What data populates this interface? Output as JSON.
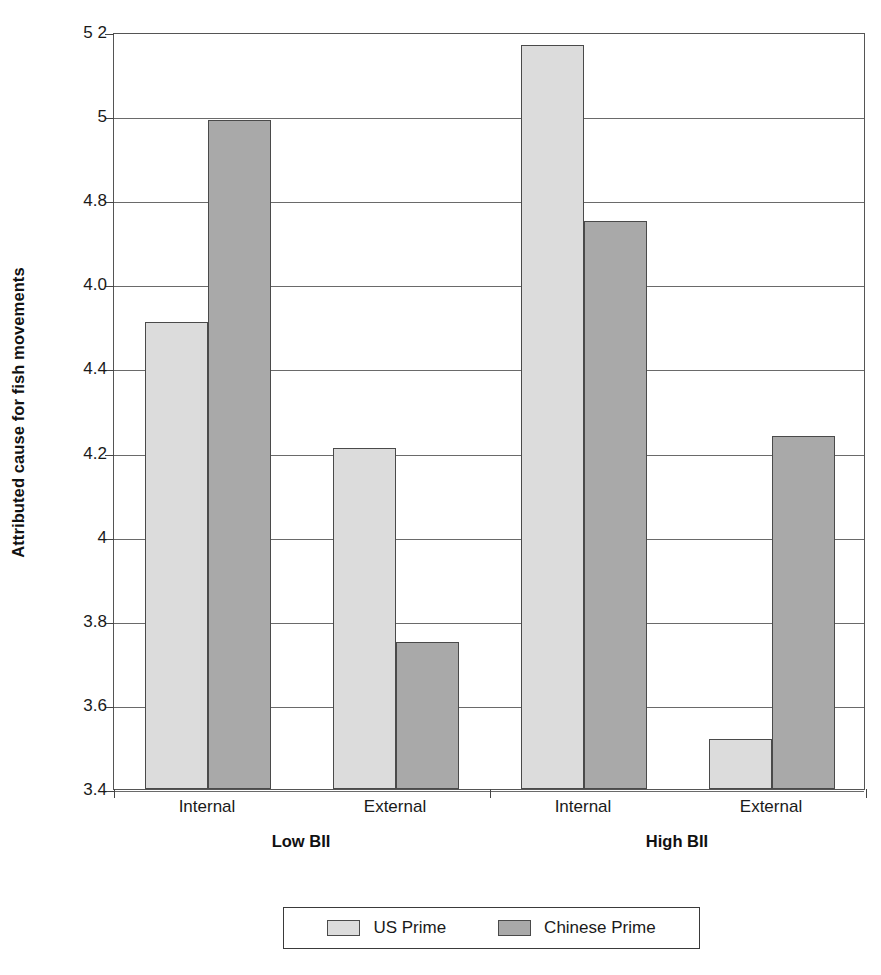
{
  "chart_data": {
    "type": "bar",
    "title": "",
    "subtitle": "",
    "xlabel": "",
    "ylabel": "Attributed cause for fish movements",
    "ylim": [
      3.4,
      5.2
    ],
    "ytick_labels": [
      "5 2",
      "5",
      "4.8",
      "4.0",
      "4.4",
      "4.2",
      "4",
      "3.8",
      "3.6",
      "3.4"
    ],
    "ytick_values": [
      5.2,
      5.0,
      4.8,
      4.6,
      4.4,
      4.2,
      4.0,
      3.8,
      3.6,
      3.4
    ],
    "grid": true,
    "legend_position": "bottom",
    "categories": [
      "Internal",
      "External",
      "Internal",
      "External"
    ],
    "groups": [
      {
        "label": "Low BII",
        "categories": [
          "Internal",
          "External"
        ]
      },
      {
        "label": "High BII",
        "categories": [
          "Internal",
          "External"
        ]
      }
    ],
    "series": [
      {
        "name": "US Prime",
        "color": "#dcdcdc",
        "values": [
          4.51,
          4.21,
          5.17,
          3.52
        ]
      },
      {
        "name": "Chinese Prime",
        "color": "#a9a9a9",
        "values": [
          4.99,
          3.75,
          4.75,
          4.24
        ]
      }
    ],
    "legend": [
      {
        "label": "US Prime",
        "color": "#dcdcdc"
      },
      {
        "label": "Chinese Prime",
        "color": "#a9a9a9"
      }
    ]
  }
}
